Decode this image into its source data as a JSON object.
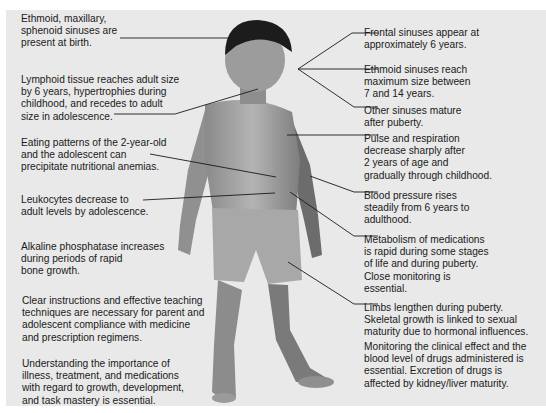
{
  "diagram": {
    "background_color": "#e9e9e9",
    "left_labels": [
      {
        "id": "sinuses-birth",
        "text": "Ethmoid, maxillary,\nsphenoid sinuses are\npresent at birth."
      },
      {
        "id": "lymphoid",
        "text": "Lymphoid tissue reaches adult size\nby 6 years, hypertrophies during\nchildhood, and recedes to adult\nsize in adolescence."
      },
      {
        "id": "eating",
        "text": "Eating patterns of the 2-year-old\nand the adolescent can\nprecipitate nutritional anemias."
      },
      {
        "id": "leukocytes",
        "text": "Leukocytes decrease to\nadult levels by adolescence."
      },
      {
        "id": "alkaline",
        "text": "Alkaline phosphatase increases\nduring periods of rapid\nbone growth."
      },
      {
        "id": "instructions",
        "text": "Clear instructions and effective teaching\ntechniques are necessary for parent and\nadolescent compliance with medicine\nand prescription regimens."
      },
      {
        "id": "understanding",
        "text": "Understanding the importance of\nillness, treatment, and medications\nwith regard to growth, development,\nand task mastery is essential."
      }
    ],
    "right_labels": [
      {
        "id": "frontal",
        "text": "Frontal sinuses appear at\napproximately 6 years."
      },
      {
        "id": "ethmoid-max",
        "text": "Ethmoid sinuses reach\nmaximum size between\n7 and 14 years."
      },
      {
        "id": "other-sinuses",
        "text": "Other sinuses mature\nafter puberty."
      },
      {
        "id": "pulse",
        "text": "Pulse and respiration\ndecrease sharply after\n2 years of age and\ngradually through childhood."
      },
      {
        "id": "bp",
        "text": "Blood pressure rises\nsteadily from 6 years to\nadulthood."
      },
      {
        "id": "metabolism",
        "text": "Metabolism of medications\nis rapid during some stages\nof life and during puberty.\nClose monitoring is\nessential."
      },
      {
        "id": "limbs",
        "text": "Limbs lengthen during puberty.\nSkeletal growth is linked to sexual\nmaturity due to hormonal influences."
      },
      {
        "id": "monitoring",
        "text": "Monitoring the clinical effect and the\nblood level of drugs administered is\nessential. Excretion of drugs is\naffected by kidney/liver maturity."
      }
    ]
  }
}
